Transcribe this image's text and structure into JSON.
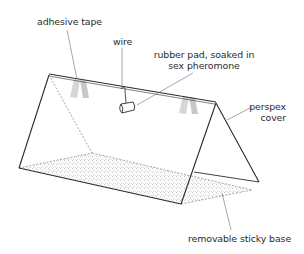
{
  "diagram": {
    "title": "",
    "type": "labelled illustration",
    "colors": {
      "line": "#2b2b2b",
      "leader": "#6b6b6b",
      "tape": "#d4d4d4",
      "stipple": "#8a8a8a",
      "background": "#ffffff"
    }
  },
  "labels": {
    "adhesive_tape": "adhesive tape",
    "wire": "wire",
    "rubber_pad_line1": "rubber pad, soaked in",
    "rubber_pad_line2": "sex pheromone",
    "perspex_line1": "perspex",
    "perspex_line2": "cover",
    "sticky_base": "removable sticky base"
  }
}
